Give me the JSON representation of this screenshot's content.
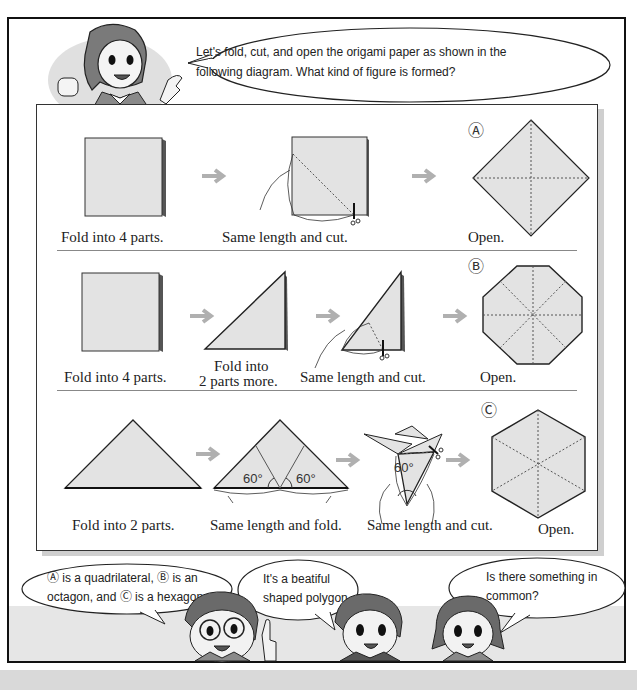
{
  "teacher": {
    "speech": [
      "Let's fold, cut, and open the origami paper as shown in the",
      "following diagram. What kind of figure is formed?"
    ]
  },
  "diagram": {
    "rows": [
      {
        "id": "A",
        "marker": "Ⓐ",
        "steps": [
          "Fold into 4 parts.",
          "Same length and cut.",
          "Open."
        ],
        "result_shape": "quadrilateral"
      },
      {
        "id": "B",
        "marker": "Ⓑ",
        "steps": [
          "Fold into 4 parts.",
          "Fold into",
          "2 parts more.",
          "Same length and cut.",
          "Open."
        ],
        "result_shape": "octagon"
      },
      {
        "id": "C",
        "marker": "Ⓒ",
        "steps": [
          "Fold into 2 parts.",
          "Same length and fold.",
          "Same length and cut.",
          "Open."
        ],
        "angle_labels": [
          "60°",
          "60°",
          "60°"
        ],
        "result_shape": "hexagon"
      }
    ],
    "arrow_glyph": "→"
  },
  "students": [
    {
      "name": "boy-with-glasses",
      "speech": [
        "Ⓐ is a quadrilateral, Ⓑ is an",
        "octagon, and Ⓒ is a hexagon."
      ]
    },
    {
      "name": "boy",
      "speech": [
        "It's a beatiful",
        "shaped polygon."
      ]
    },
    {
      "name": "girl",
      "speech": [
        "Is there something in",
        "common?"
      ]
    }
  ],
  "colors": {
    "paper_fill": "#e3e3e3",
    "arrow": "#b0b0b0",
    "frame": "#111111",
    "band": "#e6e6e6"
  }
}
